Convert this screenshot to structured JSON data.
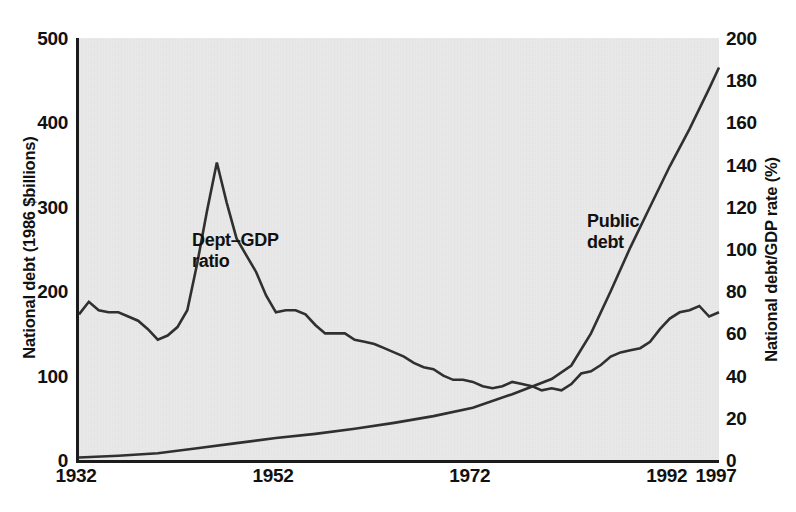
{
  "chart_data": {
    "type": "line",
    "title": "",
    "xlabel": "",
    "ylabel": "National debt (1986 $billions)",
    "ylabel_right": "National debt/GDP rate (%)",
    "xlim": [
      1932,
      1997
    ],
    "ylim": [
      0,
      500
    ],
    "ylim_right": [
      0,
      200
    ],
    "grid": false,
    "legend": "inline annotations",
    "x_ticks": [
      "1932",
      "1952",
      "1972",
      "1992",
      "1997"
    ],
    "x_tick_values": [
      1932,
      1952,
      1972,
      1992,
      1997
    ],
    "y_ticks_left": [
      "0",
      "100",
      "200",
      "300",
      "400",
      "500"
    ],
    "y_tick_values_left": [
      0,
      100,
      200,
      300,
      400,
      500
    ],
    "y_ticks_right": [
      "0",
      "20",
      "40",
      "60",
      "80",
      "100",
      "120",
      "140",
      "160",
      "180",
      "200"
    ],
    "y_tick_values_right": [
      0,
      20,
      40,
      60,
      80,
      100,
      120,
      140,
      160,
      180,
      200
    ],
    "series": [
      {
        "name": "Dept–GDP ratio",
        "axis": "right",
        "unit": "%",
        "annotation": "Dept–GDP\nratio",
        "x": [
          1932,
          1933,
          1934,
          1935,
          1936,
          1937,
          1938,
          1939,
          1940,
          1941,
          1942,
          1943,
          1944,
          1945,
          1946,
          1947,
          1948,
          1949,
          1950,
          1951,
          1952,
          1953,
          1954,
          1955,
          1956,
          1957,
          1958,
          1959,
          1960,
          1961,
          1962,
          1963,
          1964,
          1965,
          1966,
          1967,
          1968,
          1969,
          1970,
          1971,
          1972,
          1973,
          1974,
          1975,
          1976,
          1977,
          1978,
          1979,
          1980,
          1981,
          1982,
          1983,
          1984,
          1985,
          1986,
          1987,
          1988,
          1989,
          1990,
          1991,
          1992,
          1993,
          1994,
          1995,
          1996,
          1997
        ],
        "values": [
          69,
          75,
          71,
          70,
          70,
          68,
          66,
          62,
          57,
          59,
          63,
          71,
          93,
          118,
          141,
          122,
          105,
          97,
          89,
          78,
          70,
          71,
          71,
          69,
          64,
          60,
          60,
          60,
          57,
          56,
          55,
          53,
          51,
          49,
          46,
          44,
          43,
          40,
          38,
          38,
          37,
          35,
          34,
          35,
          37,
          36,
          35,
          33,
          34,
          33,
          36,
          41,
          42,
          45,
          49,
          51,
          52,
          53,
          56,
          62,
          67,
          70,
          71,
          73,
          68,
          70
        ]
      },
      {
        "name": "Public debt",
        "axis": "left",
        "unit": "1986 $billions",
        "annotation": "Public\ndebt",
        "x": [
          1932,
          1936,
          1940,
          1944,
          1948,
          1952,
          1956,
          1960,
          1964,
          1968,
          1972,
          1976,
          1980,
          1982,
          1984,
          1986,
          1988,
          1990,
          1992,
          1994,
          1996,
          1997
        ],
        "values": [
          3,
          5,
          8,
          14,
          20,
          26,
          31,
          37,
          44,
          52,
          62,
          78,
          96,
          112,
          150,
          200,
          252,
          300,
          348,
          392,
          440,
          465
        ]
      }
    ]
  },
  "axes": {
    "left_title": "National debt (1986 $billions)",
    "right_title": "National debt/GDP rate (%)"
  },
  "annotations": {
    "ratio_line1": "Dept–GDP",
    "ratio_line2": "ratio",
    "public_line1": "Public",
    "public_line2": "debt"
  },
  "colors": {
    "plot_background": "#e9e9e9",
    "page_background": "#ffffff",
    "line": "#30302f",
    "axis": "#1b1b1b",
    "text": "#111111"
  }
}
